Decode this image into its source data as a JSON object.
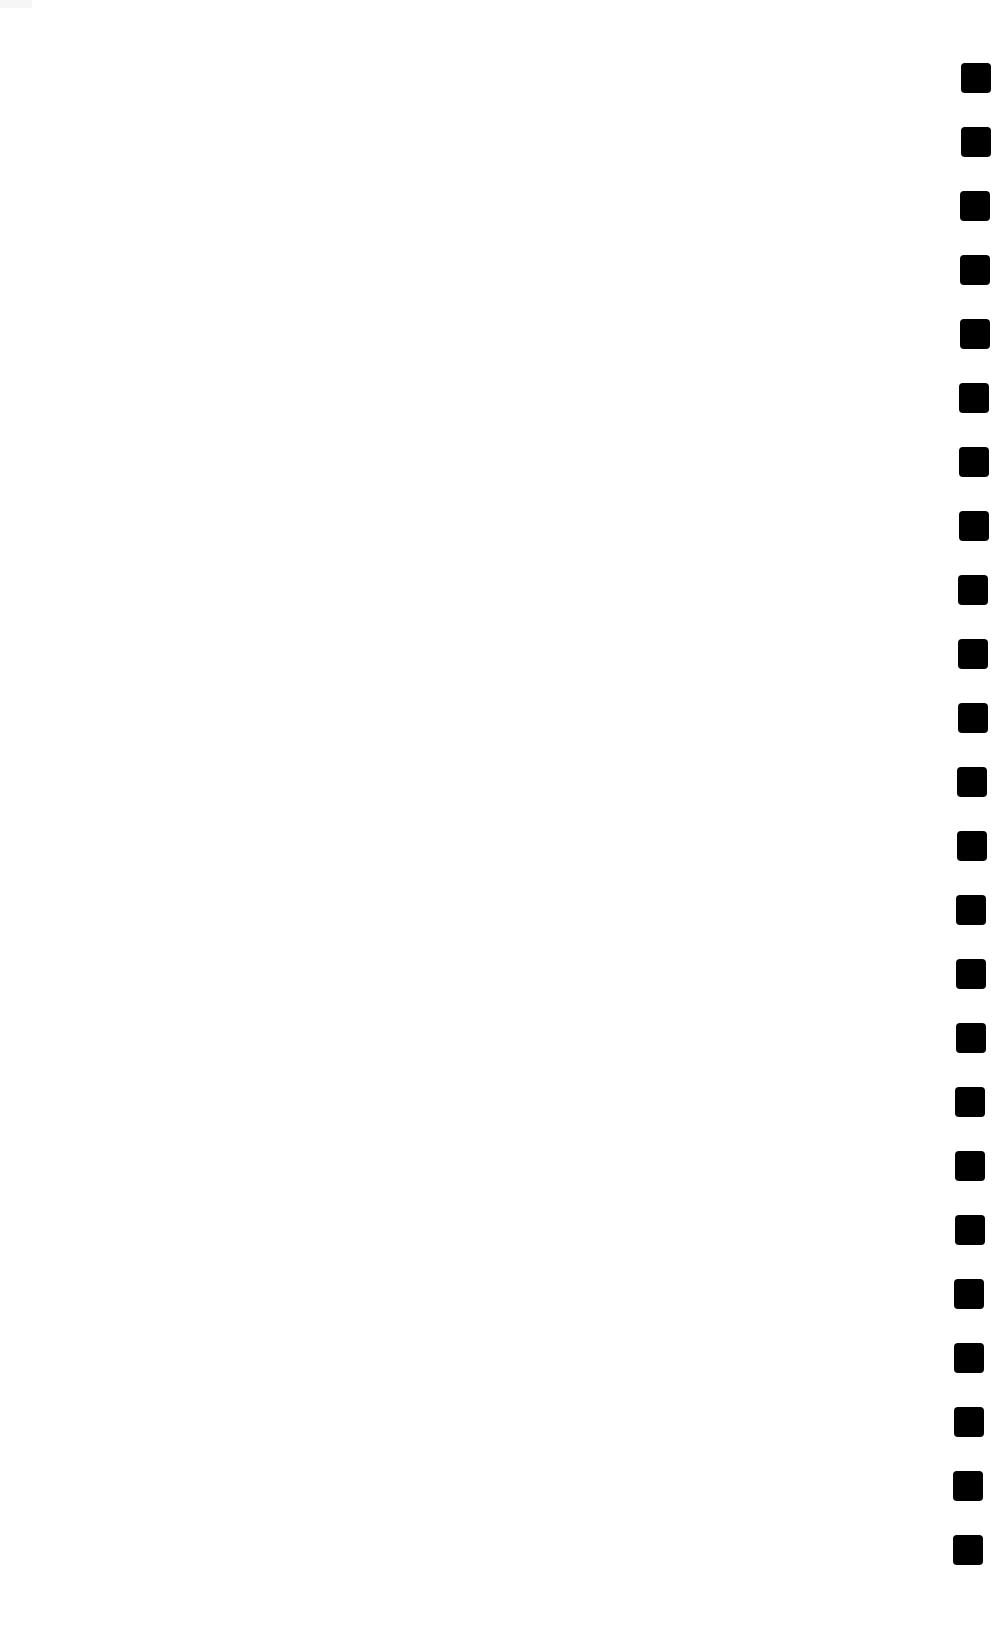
{
  "page": {
    "background": "#ffffff",
    "width": 1000,
    "height": 1629
  },
  "perforation_strip": {
    "side": "right",
    "hole_color": "#000000",
    "hole_size": 30,
    "count": 24,
    "first_top": 63,
    "pitch": 64,
    "first_left": 961,
    "last_left": 953
  }
}
